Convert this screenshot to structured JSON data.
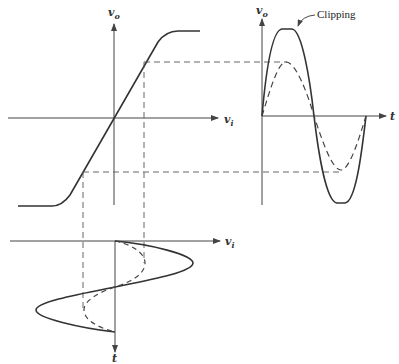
{
  "diagram": {
    "transfer_plot": {
      "y_axis_label": {
        "main": "v",
        "sub": "o"
      },
      "x_axis_label": {
        "main": "v",
        "sub": "i"
      }
    },
    "output_plot": {
      "y_axis_label": {
        "main": "v",
        "sub": "o"
      },
      "x_axis_label": "t",
      "annotation": "Clipping",
      "series": [
        {
          "name": "large input output (clipped)",
          "style": "solid"
        },
        {
          "name": "small input output",
          "style": "dashed"
        }
      ]
    },
    "input_plot": {
      "x_axis_label": {
        "main": "v",
        "sub": "i"
      },
      "y_axis_label": "t",
      "series": [
        {
          "name": "large input",
          "style": "solid"
        },
        {
          "name": "small input",
          "style": "dashed"
        }
      ]
    },
    "colors": {
      "line": "#333333",
      "background": "#ffffff"
    }
  }
}
